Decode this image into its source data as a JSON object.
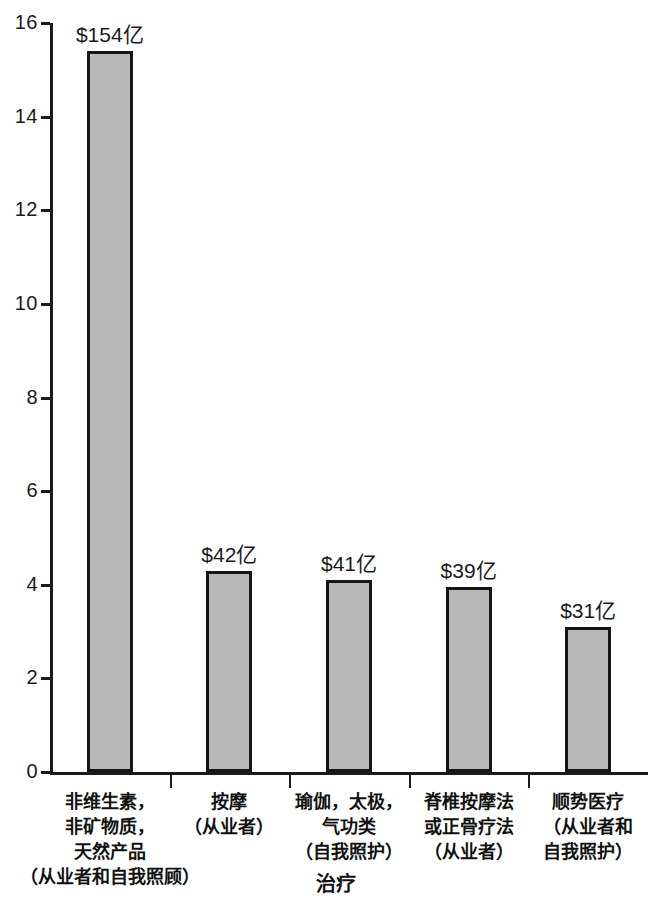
{
  "chart_data": {
    "type": "bar",
    "title": "",
    "subtitle": "",
    "xlabel": "治疗",
    "ylabel": "",
    "ylim": [
      0,
      16
    ],
    "ytick_labels": [
      "16",
      "14",
      "12",
      "10",
      "8",
      "6",
      "4",
      "2",
      "0"
    ],
    "ytick_values": [
      16,
      14,
      12,
      10,
      8,
      6,
      4,
      2,
      0
    ],
    "grid": false,
    "legend": null,
    "categories": [
      "非维生素，非矿物质，天然产品（从业者和自我照顾）",
      "按摩（从业者）",
      "瑜伽，太极，气功类（自我照护）",
      "脊椎按摩法或正骨疗法（从业者）",
      "顺势医疗（从业者和自我照护）"
    ],
    "category_lines": [
      [
        "非维生素，",
        "非矿物质，",
        "天然产品",
        "（从业者和自我照顾）"
      ],
      [
        "按摩",
        "（从业者）"
      ],
      [
        "瑜伽，太极，",
        "气功类",
        "（自我照护）"
      ],
      [
        "脊椎按摩法",
        "或正骨疗法",
        "（从业者）"
      ],
      [
        "顺势医疗",
        "（从业者和",
        "自我照护）"
      ]
    ],
    "values": [
      15.4,
      4.3,
      4.1,
      3.95,
      3.1
    ],
    "data_labels": [
      "$154亿",
      "$42亿",
      "$41亿",
      "$39亿",
      "$31亿"
    ],
    "bar_color": "#b8b8b8",
    "bar_edge_color": "#161616",
    "axis_color": "#1a1a1a"
  }
}
